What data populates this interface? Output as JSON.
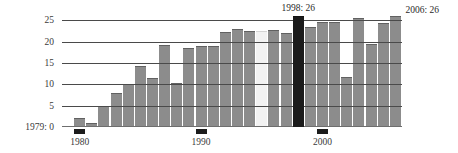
{
  "chart_data": {
    "type": "bar",
    "title": "",
    "subtitle": "",
    "xlabel": "",
    "ylabel": "",
    "ylim": [
      0,
      26
    ],
    "xlim": [
      1979,
      2006
    ],
    "grid": true,
    "gridlines_y": [
      5,
      10,
      15,
      20,
      25
    ],
    "legend": null,
    "yticks": [
      "25",
      "20",
      "15",
      "10",
      "5"
    ],
    "ytick_values": [
      25,
      20,
      15,
      10,
      5
    ],
    "xticks": [
      "1980",
      "1990",
      "2000"
    ],
    "xtick_values": [
      1980,
      1990,
      2000
    ],
    "zero_label": "1979: 0",
    "categories": [
      "1979",
      "1980",
      "1981",
      "1982",
      "1983",
      "1984",
      "1985",
      "1986",
      "1987",
      "1988",
      "1989",
      "1990",
      "1991",
      "1992",
      "1993",
      "1994",
      "1995",
      "1996",
      "1997",
      "1998",
      "1999",
      "2000",
      "2001",
      "2002",
      "2003",
      "2004",
      "2005",
      "2006"
    ],
    "values": [
      0.3,
      2.0,
      1.0,
      5.0,
      8.0,
      10.0,
      14.3,
      11.5,
      19.3,
      10.4,
      18.6,
      19.0,
      19.0,
      22.3,
      23.0,
      22.5,
      22.5,
      22.8,
      22.0,
      26.0,
      23.4,
      24.6,
      24.7,
      11.8,
      25.5,
      19.4,
      24.4,
      26.0
    ],
    "highlights": [
      {
        "category": "1995",
        "style": "light",
        "color": "#f2f2f2"
      },
      {
        "category": "1998",
        "style": "dark",
        "color": "#1b1b1b"
      }
    ],
    "bar_color": "#8c8c8c",
    "annotations": [
      {
        "name": "peak-1998",
        "text": "1998: 26",
        "category": "1998",
        "value": 26
      },
      {
        "name": "last-2006",
        "text": "2006: 26",
        "category": "2006",
        "value": 26
      }
    ]
  },
  "colors": {
    "bar": "#8c8c8c",
    "bar_light": "#f2f2f2",
    "bar_dark": "#1b1b1b",
    "grid": "#4a4a4a",
    "axis": "#6e6e6e",
    "text": "#3a3a3a",
    "tick": "#1c1c1c",
    "background": "#ffffff"
  }
}
